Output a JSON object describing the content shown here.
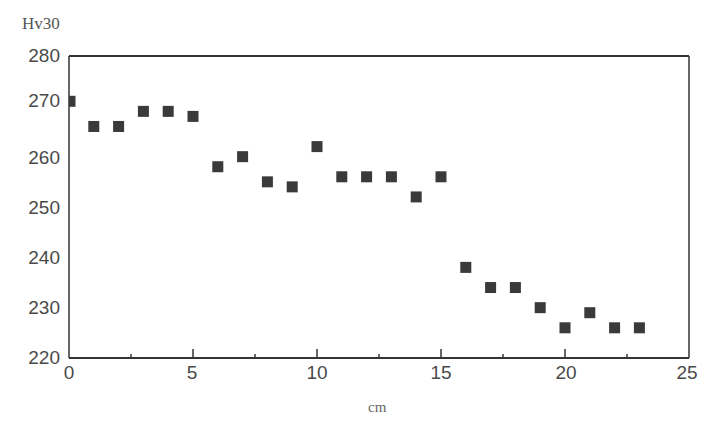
{
  "chart_data": {
    "type": "scatter",
    "title": "",
    "xlabel": "cm",
    "ylabel": "Hv30",
    "xlim": [
      0,
      25
    ],
    "ylim": [
      220,
      280
    ],
    "x_ticks": [
      "0",
      "5",
      "10",
      "15",
      "20",
      "25"
    ],
    "y_ticks": [
      "220",
      "230",
      "240",
      "250",
      "260",
      "270",
      "280"
    ],
    "grid": false,
    "legend": null,
    "marker": "square",
    "marker_color": "#3a3a3a",
    "series": [
      {
        "name": "Hv30",
        "x": [
          0,
          1,
          2,
          3,
          4,
          5,
          6,
          7,
          8,
          9,
          10,
          11,
          12,
          13,
          14,
          15,
          16,
          17,
          18,
          19,
          20,
          21,
          22,
          23
        ],
        "y": [
          271,
          266,
          266,
          269,
          269,
          268,
          258,
          260,
          255,
          254,
          262,
          256,
          256,
          256,
          252,
          256,
          238,
          234,
          234,
          230,
          226,
          229,
          226,
          226
        ]
      }
    ]
  },
  "axis": {
    "ylabel": "Hv30",
    "xlabel": "cm",
    "y_ticks": [
      "280",
      "270",
      "260",
      "250",
      "240",
      "230",
      "220"
    ],
    "x_ticks": [
      "0",
      "5",
      "10",
      "15",
      "20",
      "25"
    ]
  }
}
